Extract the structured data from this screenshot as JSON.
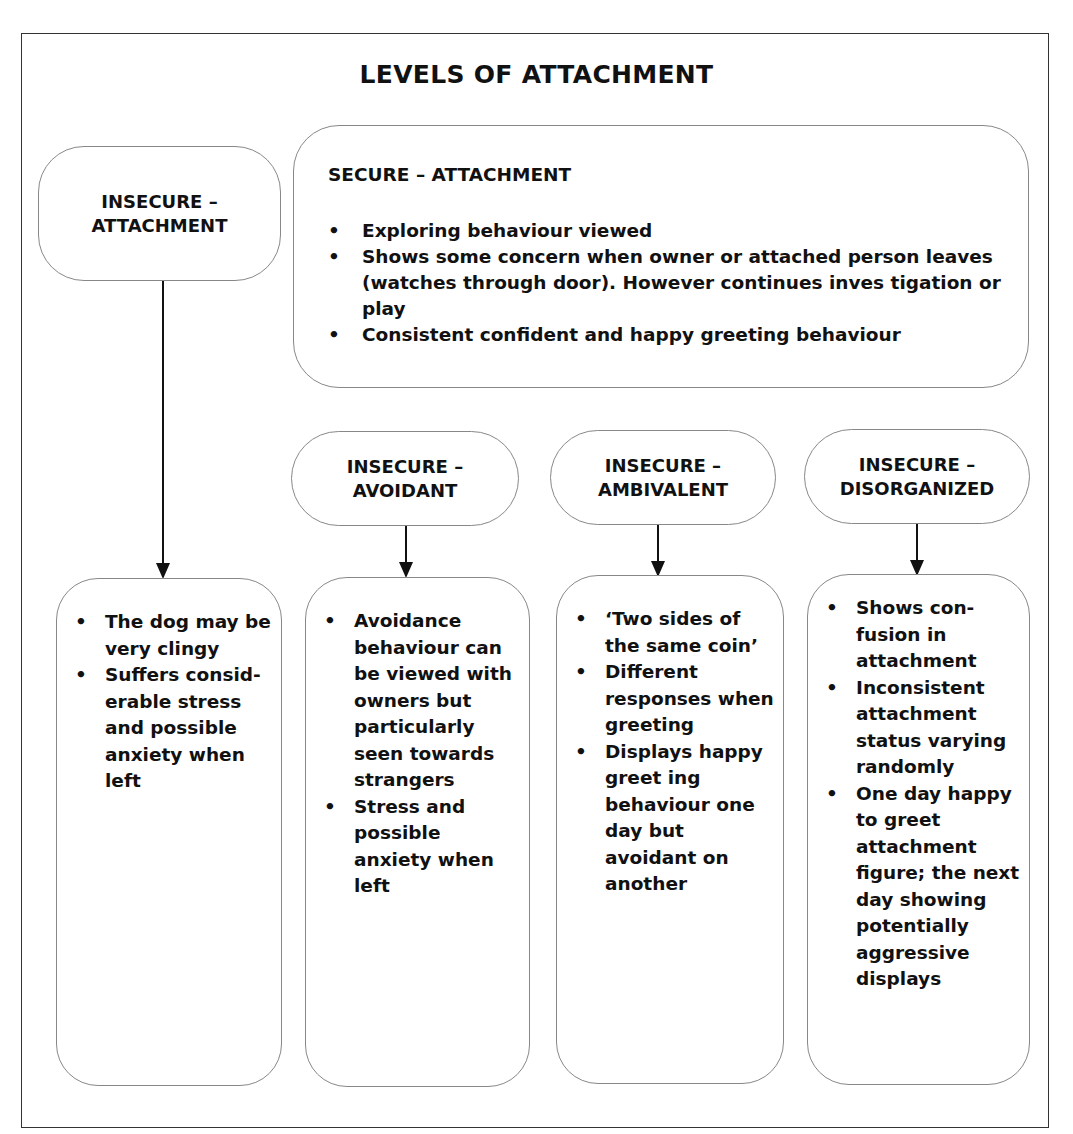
{
  "title": "LEVELS OF ATTACHMENT",
  "insecure_attachment": {
    "line1": "INSECURE –",
    "line2": "ATTACHMENT",
    "details": [
      "The dog may be very clingy",
      "Suffers consid-erable stress and possible anxiety when left"
    ]
  },
  "secure_attachment": {
    "heading": "SECURE – ATTACHMENT",
    "bullets": [
      "Exploring behaviour viewed",
      "Shows some concern when owner or attached person leaves (watches through door). However continues inves tigation or play",
      "Consistent confident and happy greeting behaviour"
    ]
  },
  "subtypes": [
    {
      "line1": "INSECURE –",
      "line2": "AVOIDANT",
      "details": [
        "Avoidance behaviour can be viewed with owners but particularly seen towards strangers",
        "Stress and possible anxiety when left"
      ]
    },
    {
      "line1": "INSECURE –",
      "line2": "AMBIVALENT",
      "details": [
        "‘Two sides of the same coin’",
        "Different responses when greeting",
        "Displays happy greet ing behaviour one day but avoidant on another"
      ]
    },
    {
      "line1": "INSECURE –",
      "line2": "DISORGANIZED",
      "details": [
        "Shows con-fusion in attachment",
        "Inconsistent attachment status varying randomly",
        "One day happy to greet attachment figure; the next day showing potentially aggressive displays"
      ]
    }
  ]
}
